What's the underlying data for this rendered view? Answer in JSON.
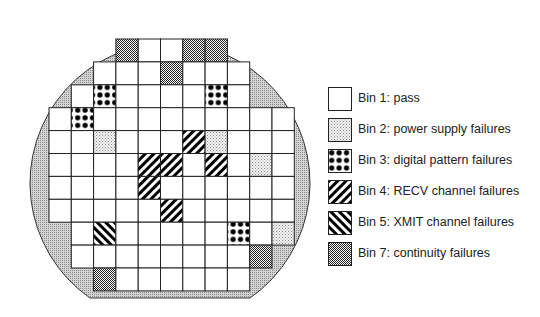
{
  "diagram": {
    "type": "wafer-map",
    "grid": {
      "rows": [
        {
          "start_col": 3,
          "bins": [
            7,
            1,
            1,
            7,
            7
          ]
        },
        {
          "start_col": 2,
          "bins": [
            1,
            1,
            1,
            7,
            1,
            1,
            1
          ]
        },
        {
          "start_col": 1,
          "bins": [
            1,
            3,
            1,
            1,
            1,
            1,
            3,
            1
          ]
        },
        {
          "start_col": 0,
          "bins": [
            1,
            3,
            1,
            1,
            1,
            1,
            1,
            1,
            1,
            1,
            1
          ]
        },
        {
          "start_col": 0,
          "bins": [
            1,
            1,
            2,
            1,
            1,
            1,
            4,
            2,
            1,
            1,
            1
          ]
        },
        {
          "start_col": 0,
          "bins": [
            1,
            1,
            1,
            1,
            4,
            4,
            1,
            4,
            1,
            2,
            1
          ]
        },
        {
          "start_col": 0,
          "bins": [
            1,
            1,
            1,
            1,
            4,
            1,
            1,
            1,
            1,
            1,
            1
          ]
        },
        {
          "start_col": 0,
          "bins": [
            1,
            1,
            1,
            1,
            1,
            4,
            1,
            1,
            1,
            1,
            1
          ]
        },
        {
          "start_col": 1,
          "bins": [
            1,
            5,
            1,
            1,
            1,
            1,
            1,
            3,
            1,
            2
          ]
        },
        {
          "start_col": 1,
          "bins": [
            1,
            1,
            1,
            1,
            1,
            1,
            1,
            1,
            7
          ]
        },
        {
          "start_col": 2,
          "bins": [
            7,
            1,
            1,
            1,
            1,
            1,
            1
          ]
        }
      ]
    }
  },
  "legend": {
    "items": [
      {
        "bin": 1,
        "pattern": "blank",
        "label": "Bin 1: pass"
      },
      {
        "bin": 2,
        "pattern": "light-dots",
        "label": "Bin 2: power supply failures"
      },
      {
        "bin": 3,
        "pattern": "large-dots",
        "label": "Bin 3: digital pattern failures"
      },
      {
        "bin": 4,
        "pattern": "diagonal-down",
        "label": "Bin 4: RECV channel failures"
      },
      {
        "bin": 5,
        "pattern": "diagonal-up",
        "label": "Bin 5: XMIT channel failures"
      },
      {
        "bin": 7,
        "pattern": "checker",
        "label": "Bin 7: continuity failures"
      }
    ]
  }
}
